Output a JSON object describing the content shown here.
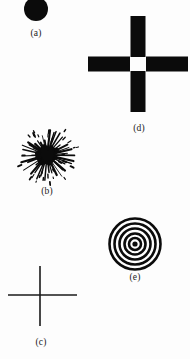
{
  "figure": {
    "background_color": "#fdfdfd",
    "ink_color": "#0b0b0b",
    "width": 190,
    "height": 359,
    "panels": [
      {
        "key": "a",
        "label": "(a)",
        "shape_name": "filled-disc",
        "description": "solid black filled circle, clipped at the top edge of the page",
        "center_x": 36,
        "center_y": 9,
        "radius": 12,
        "fill": "#0b0b0b"
      },
      {
        "key": "d",
        "label": "(d)",
        "shape_name": "thick-cross",
        "description": "thick black plus sign with four rectangular arms and a small white gap at the centre",
        "center_x": 138,
        "center_y": 64,
        "arm_length": 48,
        "arm_thickness": 15,
        "center_gap": 7,
        "fill": "#0b0b0b"
      },
      {
        "key": "b",
        "label": "(b)",
        "shape_name": "starburst",
        "description": "dense black blob core with many radiating spikes and scattered dots, like an explosion or a sunburst",
        "center_x": 46,
        "center_y": 154,
        "core_radius": 11,
        "spike_count": 40,
        "dot_count": 34,
        "outer_radius": 28,
        "fill": "#0b0b0b"
      },
      {
        "key": "e",
        "label": "(e)",
        "shape_name": "concentric-rings",
        "description": "bullseye of five black concentric circle outlines around a small solid dark centre",
        "center_x": 135,
        "center_y": 244,
        "ring_count": 5,
        "ring_radii": [
          25.5,
          20.5,
          15.5,
          10.5,
          6
        ],
        "ring_stroke_width": 2.6,
        "center_dot_radius": 2.6,
        "stroke": "#0b0b0b"
      },
      {
        "key": "c",
        "label": "(c)",
        "shape_name": "thin-cross",
        "description": "thin line plus sign: one vertical stroke and one horizontal stroke crossing off-centre",
        "center_x": 40,
        "center_y": 295,
        "vertical_from_y": 266,
        "vertical_to_y": 326,
        "horizontal_from_x": 8,
        "horizontal_to_x": 77,
        "stroke_width": 1.6,
        "stroke": "#1a1a1a"
      }
    ]
  }
}
